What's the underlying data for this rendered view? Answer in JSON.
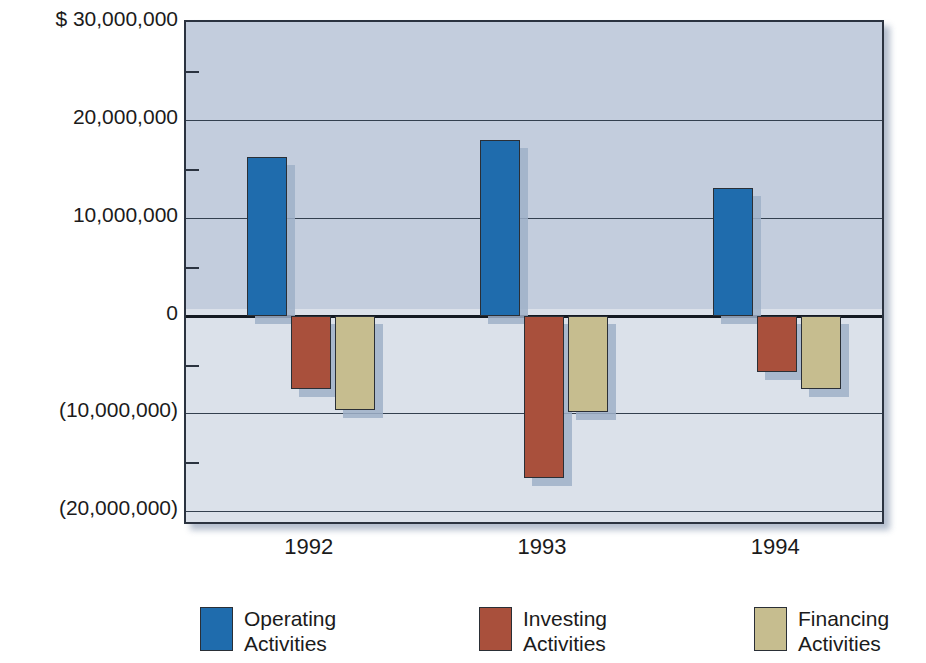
{
  "chart_data": {
    "type": "bar",
    "title": "",
    "subtitle": "",
    "xlabel": "",
    "ylabel": "",
    "categories": [
      "1992",
      "1993",
      "1994"
    ],
    "series": [
      {
        "name": "Operating Activities",
        "color": "#1f6cad",
        "values": [
          16200000,
          17900000,
          13000000
        ]
      },
      {
        "name": "Investing Activities",
        "color": "#a9503c",
        "values": [
          -7500000,
          -16600000,
          -5800000
        ]
      },
      {
        "name": "Financing Activities",
        "color": "#c6bd8f",
        "values": [
          -9600000,
          -9900000,
          -7500000
        ]
      }
    ],
    "ylim": [
      -21500000,
      30000000
    ],
    "y_major_ticks": [
      {
        "value": 30000000,
        "label": "$ 30,000,000"
      },
      {
        "value": 20000000,
        "label": "20,000,000"
      },
      {
        "value": 10000000,
        "label": "10,000,000"
      },
      {
        "value": 0,
        "label": "0"
      },
      {
        "value": -10000000,
        "label": "(10,000,000)"
      },
      {
        "value": -20000000,
        "label": "(20,000,000)"
      }
    ],
    "y_minor_ticks": [
      25000000,
      15000000,
      5000000,
      -5000000,
      -15000000
    ],
    "grid": true,
    "legend_position": "bottom",
    "currency_symbol": "$",
    "value_format": "negatives in parentheses"
  },
  "axis": {
    "y_labels": [
      "$ 30,000,000",
      "20,000,000",
      "10,000,000",
      "0",
      "(10,000,000)",
      "(20,000,000)"
    ],
    "x_labels": [
      "1992",
      "1993",
      "1994"
    ]
  },
  "legend": {
    "items": [
      {
        "label_line1": "Operating",
        "label_line2": "Activities",
        "color": "#1f6cad"
      },
      {
        "label_line1": "Investing",
        "label_line2": "Activities",
        "color": "#a9503c"
      },
      {
        "label_line1": "Financing",
        "label_line2": "Activities",
        "color": "#c6bd8f"
      }
    ]
  },
  "colors": {
    "operating": "#1f6cad",
    "investing": "#a9503c",
    "financing": "#c6bd8f",
    "plot_upper_bg": "#c3cddd",
    "plot_lower_bg": "#dbe1ea",
    "axis_line": "#2b3340",
    "text": "#1b1b1b"
  }
}
